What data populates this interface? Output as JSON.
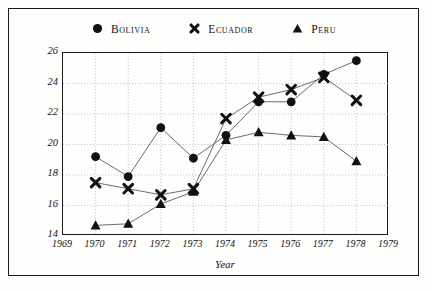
{
  "chart_data": {
    "type": "line",
    "title": "",
    "xlabel": "Year",
    "ylabel": "Percent GDP",
    "x": [
      1970,
      1971,
      1972,
      1973,
      1974,
      1975,
      1976,
      1977,
      1978
    ],
    "xlim": [
      1969,
      1979
    ],
    "ylim": [
      14,
      26
    ],
    "xticks": [
      "1969",
      "1970",
      "1971",
      "1972",
      "1973",
      "1974",
      "1975",
      "1976",
      "1977",
      "1978",
      "1979"
    ],
    "yticks": [
      "14",
      "16",
      "18",
      "20",
      "22",
      "24",
      "26"
    ],
    "grid": true,
    "legend_position": "top-center",
    "series": [
      {
        "name": "Bolivia",
        "marker": "circle",
        "color": "#111111",
        "values": [
          19.2,
          17.9,
          21.1,
          19.1,
          20.6,
          22.8,
          22.8,
          24.6,
          25.5
        ]
      },
      {
        "name": "Ecuador",
        "marker": "cross",
        "color": "#111111",
        "values": [
          17.5,
          17.1,
          16.7,
          17.1,
          21.7,
          23.1,
          23.6,
          24.4,
          22.9
        ]
      },
      {
        "name": "Peru",
        "marker": "triangle",
        "color": "#111111",
        "values": [
          14.7,
          14.8,
          16.1,
          16.9,
          20.3,
          20.8,
          20.6,
          20.5,
          18.9
        ]
      }
    ]
  },
  "legend": {
    "entries": [
      {
        "label": "Bolivia",
        "marker": "circle-marker-icon"
      },
      {
        "label": "Ecuador",
        "marker": "cross-marker-icon"
      },
      {
        "label": "Peru",
        "marker": "triangle-marker-icon"
      }
    ]
  },
  "axes": {
    "y_title": "Percent GDP",
    "x_title": "Year"
  },
  "colors": {
    "ink": "#111111",
    "frame": "#1a1a1a",
    "grid": "#b9b9b9",
    "paper": "#fdfdfb"
  }
}
